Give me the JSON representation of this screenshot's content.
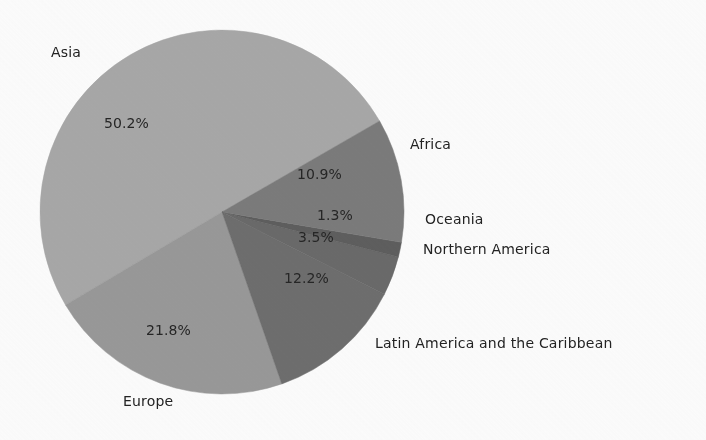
{
  "figure": {
    "background_color": "#fefefe",
    "text_color": "#262626",
    "center_x": 222,
    "center_y": 212,
    "radius": 182
  },
  "chart_data": {
    "type": "pie",
    "title": "",
    "subtitle": "",
    "xlabel": "",
    "ylabel": "",
    "legend_position": "none",
    "grid": false,
    "start_angle_deg": 30,
    "direction": "counterclockwise",
    "categories": [
      "Asia",
      "Europe",
      "Latin America and the Caribbean",
      "Northern America",
      "Oceania",
      "Africa"
    ],
    "values": [
      50.2,
      21.8,
      12.2,
      3.5,
      1.3,
      10.9
    ],
    "value_labels": [
      "50.2%",
      "21.8%",
      "12.2%",
      "3.5%",
      "1.3%",
      "10.9%"
    ],
    "colors": [
      "#a9a9a9",
      "#9a9a9a",
      "#6f6f6f",
      "#6b6b6b",
      "#5f5f5f",
      "#7c7c7c"
    ],
    "slices": [
      {
        "name": "Asia",
        "value": 50.2,
        "value_label": "50.2%",
        "color": "#a9a9a9",
        "start_deg": 30.0,
        "end_deg": 210.72,
        "pct_label_x": 104,
        "pct_label_y": 115,
        "cat_label_x": 51,
        "cat_label_y": 44
      },
      {
        "name": "Europe",
        "value": 21.8,
        "value_label": "21.8%",
        "color": "#9a9a9a",
        "start_deg": 210.72,
        "end_deg": 289.2,
        "pct_label_x": 146,
        "pct_label_y": 322,
        "cat_label_x": 123,
        "cat_label_y": 393
      },
      {
        "name": "Latin America and the Caribbean",
        "value": 12.2,
        "value_label": "12.2%",
        "color": "#6f6f6f",
        "start_deg": 289.2,
        "end_deg": 333.12,
        "pct_label_x": 284,
        "pct_label_y": 270,
        "cat_label_x": 375,
        "cat_label_y": 335
      },
      {
        "name": "Northern America",
        "value": 3.5,
        "value_label": "3.5%",
        "color": "#6b6b6b",
        "start_deg": 333.12,
        "end_deg": 345.72,
        "pct_label_x": 298,
        "pct_label_y": 229,
        "cat_label_x": 423,
        "cat_label_y": 241
      },
      {
        "name": "Oceania",
        "value": 1.3,
        "value_label": "1.3%",
        "color": "#5f5f5f",
        "start_deg": 345.72,
        "end_deg": 350.4,
        "pct_label_x": 317,
        "pct_label_y": 207,
        "cat_label_x": 425,
        "cat_label_y": 211
      },
      {
        "name": "Africa",
        "value": 10.9,
        "value_label": "10.9%",
        "color": "#7c7c7c",
        "start_deg": 350.4,
        "end_deg": 390.0,
        "pct_label_x": 297,
        "pct_label_y": 166,
        "cat_label_x": 410,
        "cat_label_y": 136
      }
    ]
  }
}
